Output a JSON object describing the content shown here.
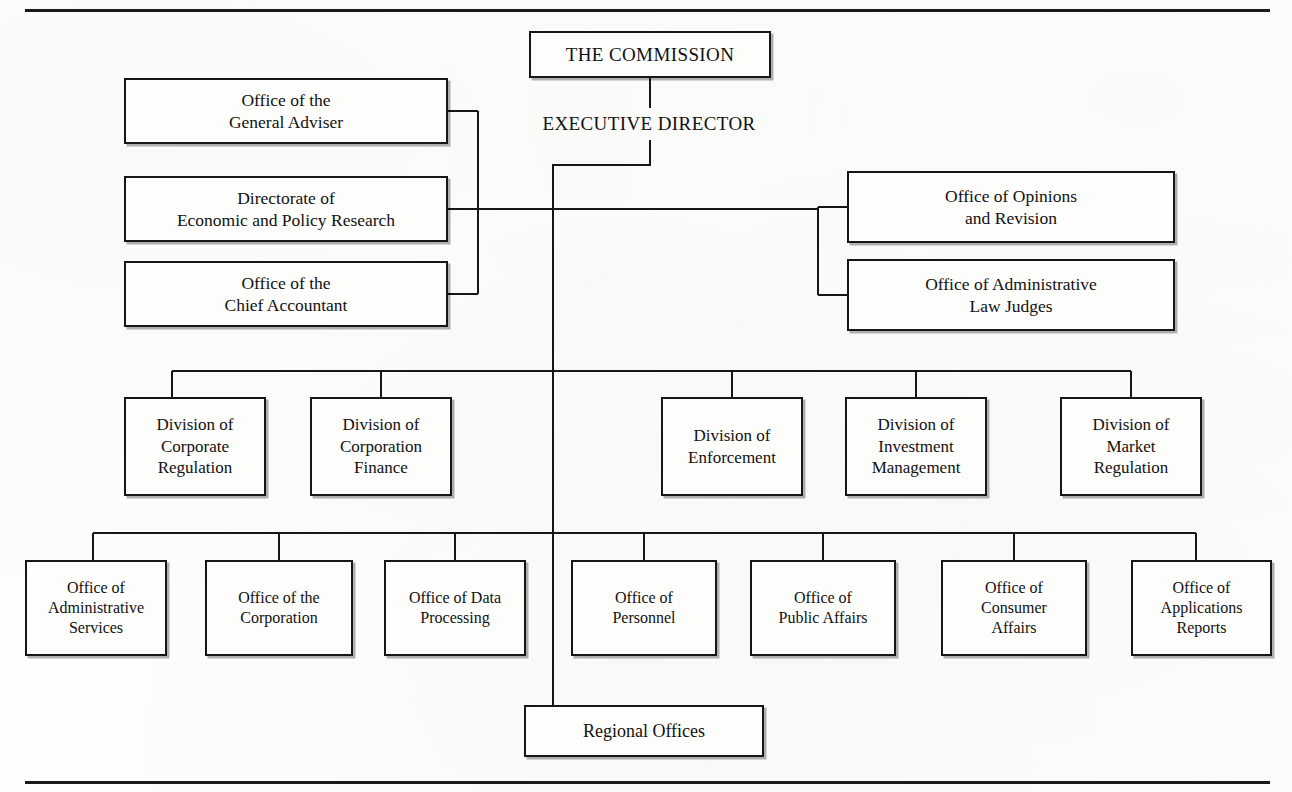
{
  "page": {
    "width": 1292,
    "height": 792,
    "background_color": "#fdfdfc",
    "line_color": "#161616",
    "text_color": "#111111"
  },
  "rules": {
    "top_rule": {
      "x": 25,
      "y": 9,
      "width": 1245,
      "height": 3
    },
    "bottom_rule": {
      "x": 25,
      "y": 781,
      "width": 1245,
      "height": 3
    }
  },
  "chart": {
    "type": "organization-chart",
    "title": "",
    "root": {
      "id": "the-commission",
      "label": "THE COMMISSION",
      "boxed": true,
      "x": 529,
      "y": 31,
      "w": 242,
      "h": 47
    },
    "executive": {
      "id": "executive-director",
      "label": "EXECUTIVE DIRECTOR",
      "boxed": false,
      "x": 509,
      "y": 108,
      "w": 280,
      "h": 32
    },
    "staff_left": [
      {
        "id": "office-general-adviser",
        "label": "Office of the\nGeneral Adviser",
        "x": 124,
        "y": 78,
        "w": 324,
        "h": 66
      },
      {
        "id": "directorate-economic-policy-research",
        "label": "Directorate of\nEconomic and Policy Research",
        "x": 124,
        "y": 176,
        "w": 324,
        "h": 66
      },
      {
        "id": "office-chief-accountant",
        "label": "Office of the\nChief Accountant",
        "x": 124,
        "y": 261,
        "w": 324,
        "h": 66
      }
    ],
    "staff_right": [
      {
        "id": "office-opinions-revision",
        "label": "Office of Opinions\nand Revision",
        "x": 847,
        "y": 171,
        "w": 328,
        "h": 72
      },
      {
        "id": "office-administrative-law-judges",
        "label": "Office of Administrative\nLaw Judges",
        "x": 847,
        "y": 259,
        "w": 328,
        "h": 72
      }
    ],
    "divisions": [
      {
        "id": "division-corporate-regulation",
        "label": "Division of\nCorporate\nRegulation",
        "x": 124,
        "y": 397,
        "w": 142,
        "h": 99
      },
      {
        "id": "division-corporation-finance",
        "label": "Division of\nCorporation\nFinance",
        "x": 310,
        "y": 397,
        "w": 142,
        "h": 99
      },
      {
        "id": "division-enforcement",
        "label": "Division of\nEnforcement",
        "x": 661,
        "y": 397,
        "w": 142,
        "h": 99
      },
      {
        "id": "division-investment-management",
        "label": "Division of\nInvestment\nManagement",
        "x": 845,
        "y": 397,
        "w": 142,
        "h": 99
      },
      {
        "id": "division-market-regulation",
        "label": "Division of\nMarket\nRegulation",
        "x": 1060,
        "y": 397,
        "w": 142,
        "h": 99
      }
    ],
    "offices": [
      {
        "id": "office-administrative-services",
        "label": "Office of\nAdministrative\nServices",
        "x": 25,
        "y": 560,
        "w": 142,
        "h": 96
      },
      {
        "id": "office-of-the-corporation",
        "label": "Office of the\nCorporation",
        "x": 205,
        "y": 560,
        "w": 148,
        "h": 96
      },
      {
        "id": "office-data-processing",
        "label": "Office of Data\nProcessing",
        "x": 384,
        "y": 560,
        "w": 142,
        "h": 96
      },
      {
        "id": "office-personnel",
        "label": "Office of\nPersonnel",
        "x": 571,
        "y": 560,
        "w": 146,
        "h": 96
      },
      {
        "id": "office-public-affairs",
        "label": "Office of\nPublic Affairs",
        "x": 750,
        "y": 560,
        "w": 146,
        "h": 96
      },
      {
        "id": "office-consumer-affairs",
        "label": "Office of\nConsumer\nAffairs",
        "x": 941,
        "y": 560,
        "w": 146,
        "h": 96
      },
      {
        "id": "office-applications-reports",
        "label": "Office of\nApplications\nReports",
        "x": 1131,
        "y": 560,
        "w": 141,
        "h": 96
      }
    ],
    "regional": {
      "id": "regional-offices",
      "label": "Regional Offices",
      "x": 524,
      "y": 705,
      "w": 240,
      "h": 52
    }
  },
  "chart_data": {
    "type": "table",
    "hierarchy": [
      {
        "level": 1,
        "name": "THE COMMISSION",
        "children": [
          {
            "level": 2,
            "name": "EXECUTIVE DIRECTOR",
            "staff_left": [
              "Office of the General Adviser",
              "Directorate of Economic and Policy Research",
              "Office of the Chief Accountant"
            ],
            "staff_right": [
              "Office of Opinions and Revision",
              "Office of Administrative Law Judges"
            ],
            "divisions": [
              "Division of Corporate Regulation",
              "Division of Corporation Finance",
              "Division of Enforcement",
              "Division of Investment Management",
              "Division of Market Regulation"
            ],
            "offices": [
              "Office of Administrative Services",
              "Office of the Corporation",
              "Office of Data Processing",
              "Office of Personnel",
              "Office of Public Affairs",
              "Office of Consumer Affairs",
              "Office of Applications Reports"
            ],
            "field": [
              "Regional Offices"
            ]
          }
        ]
      }
    ]
  }
}
